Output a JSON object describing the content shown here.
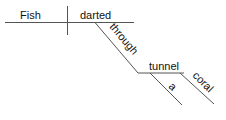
{
  "diagram": {
    "type": "sentence-diagram",
    "sentence": "Fish darted through a coral tunnel",
    "subject": "Fish",
    "verb": "darted",
    "preposition": "through",
    "object_of_preposition": "tunnel",
    "modifiers": [
      "a",
      "coral"
    ],
    "line_color": "#555555",
    "text_color": "#111111"
  }
}
